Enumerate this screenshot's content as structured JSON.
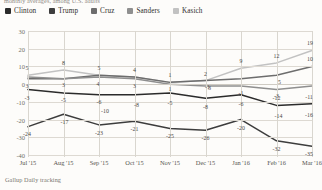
{
  "subtitle": "monthly averages, among U.S. adults",
  "footer": "Gallup Daily tracking",
  "legend": {
    "items": [
      {
        "label": "Clinton",
        "color": "#2b2b2b"
      },
      {
        "label": "Trump",
        "color": "#3d3d3d"
      },
      {
        "label": "Cruz",
        "color": "#6d6d6d"
      },
      {
        "label": "Sanders",
        "color": "#8f8f8f"
      },
      {
        "label": "Kasich",
        "color": "#c2c2c2"
      }
    ]
  },
  "chart_data": {
    "type": "line",
    "title": "",
    "subtitle": "monthly averages, among U.S. adults",
    "xlabel": "",
    "ylabel": "",
    "grid": true,
    "legend_position": "top",
    "ylim": [
      -40,
      30
    ],
    "yticks": [
      30,
      20,
      10,
      0,
      -10,
      -20,
      -30,
      -40
    ],
    "categories": [
      "Jul '15",
      "Aug '15",
      "Sep '15",
      "Oct '15",
      "Nov '15",
      "Dec '15",
      "Jan '16",
      "Feb '16",
      "Mar '16"
    ],
    "series": [
      {
        "name": "Kasich",
        "color": "#c2c2c2",
        "values": [
          5,
          8,
          5,
          4,
          1,
          2,
          9,
          12,
          19
        ]
      },
      {
        "name": "Cruz",
        "color": "#6d6d6d",
        "values": [
          3,
          3,
          5,
          4,
          1,
          2,
          3,
          5,
          10
        ]
      },
      {
        "name": "Sanders",
        "color": "#8f8f8f",
        "values": [
          4,
          3,
          4,
          3,
          0,
          -1,
          -1,
          -3,
          -1
        ]
      },
      {
        "name": "Clinton",
        "color": "#2b2b2b",
        "values": [
          -3,
          -5,
          -6,
          -6,
          -5,
          -8,
          -6,
          -12,
          -11
        ]
      },
      {
        "name": "Trump",
        "color": "#3d3d3d",
        "values": [
          -24,
          -17,
          -23,
          -21,
          -25,
          -26,
          -20,
          -32,
          -35
        ]
      }
    ],
    "point_labels": [
      {
        "text": "5",
        "x": 0,
        "y": 5,
        "dx": -1,
        "dy": -7
      },
      {
        "text": "8",
        "x": 1,
        "y": 8,
        "dx": 0,
        "dy": -7
      },
      {
        "text": "5",
        "x": 2,
        "y": 5,
        "dx": 0,
        "dy": -7
      },
      {
        "text": "4",
        "x": 3,
        "y": 4,
        "dx": 0,
        "dy": -7
      },
      {
        "text": "1",
        "x": 4,
        "y": 1,
        "dx": 0,
        "dy": -7
      },
      {
        "text": "2",
        "x": 5,
        "y": 2,
        "dx": 0,
        "dy": -7
      },
      {
        "text": "9",
        "x": 6,
        "y": 9,
        "dx": 0,
        "dy": -7
      },
      {
        "text": "12",
        "x": 7,
        "y": 12,
        "dx": 0,
        "dy": -7
      },
      {
        "text": "19",
        "x": 8,
        "y": 19,
        "dx": -2,
        "dy": -7
      },
      {
        "text": "3",
        "x": 1,
        "y": 3,
        "dx": 0,
        "dy": 6
      },
      {
        "text": "3",
        "x": 5,
        "y": 2,
        "dx": 4,
        "dy": 7
      },
      {
        "text": "5",
        "x": 7,
        "y": 5,
        "dx": 3,
        "dy": 7
      },
      {
        "text": "10",
        "x": 8,
        "y": 10,
        "dx": -2,
        "dy": -7
      },
      {
        "text": "3",
        "x": 0,
        "y": 3,
        "dx": -1,
        "dy": 7
      },
      {
        "text": "4",
        "x": 2,
        "y": 4,
        "dx": -1,
        "dy": 7
      },
      {
        "text": "3",
        "x": 3,
        "y": 3,
        "dx": 0,
        "dy": 7
      },
      {
        "text": "1",
        "x": 4,
        "y": 1,
        "dx": 0,
        "dy": 7
      },
      {
        "text": "-1",
        "x": 6,
        "y": -1,
        "dx": 0,
        "dy": 7
      },
      {
        "text": "-3",
        "x": 7,
        "y": -3,
        "dx": 0,
        "dy": 7
      },
      {
        "text": "-3",
        "x": 0,
        "y": -3,
        "dx": -1,
        "dy": 9
      },
      {
        "text": "-5",
        "x": 1,
        "y": -5,
        "dx": 0,
        "dy": 7
      },
      {
        "text": "-6",
        "x": 2,
        "y": -6,
        "dx": 0,
        "dy": 7
      },
      {
        "text": "-10",
        "x": 2,
        "y": -6,
        "dx": 6,
        "dy": 16
      },
      {
        "text": "-8",
        "x": 3,
        "y": -6,
        "dx": 2,
        "dy": 10
      },
      {
        "text": "-5",
        "x": 4,
        "y": -5,
        "dx": 0,
        "dy": 10
      },
      {
        "text": "-1",
        "x": 5,
        "y": -1,
        "dx": 2,
        "dy": 1
      },
      {
        "text": "-8",
        "x": 5,
        "y": -8,
        "dx": 0,
        "dy": 9
      },
      {
        "text": "-6",
        "x": 6,
        "y": -6,
        "dx": 0,
        "dy": 9
      },
      {
        "text": "-12",
        "x": 7,
        "y": -12,
        "dx": 0,
        "dy": -7
      },
      {
        "text": "-14",
        "x": 7,
        "y": -12,
        "dx": 2,
        "dy": 11
      },
      {
        "text": "-11",
        "x": 8,
        "y": -11,
        "dx": -3,
        "dy": -7
      },
      {
        "text": "-16",
        "x": 8,
        "y": -11,
        "dx": -3,
        "dy": 11
      },
      {
        "text": "-24",
        "x": 0,
        "y": -24,
        "dx": -1,
        "dy": 7
      },
      {
        "text": "-17",
        "x": 1,
        "y": -17,
        "dx": 1,
        "dy": 8
      },
      {
        "text": "-23",
        "x": 2,
        "y": -23,
        "dx": 0,
        "dy": 8
      },
      {
        "text": "-21",
        "x": 3,
        "y": -21,
        "dx": 0,
        "dy": 8
      },
      {
        "text": "-25",
        "x": 4,
        "y": -25,
        "dx": 0,
        "dy": 8
      },
      {
        "text": "-26",
        "x": 5,
        "y": -26,
        "dx": 0,
        "dy": 8
      },
      {
        "text": "-20",
        "x": 6,
        "y": -20,
        "dx": 0,
        "dy": 8
      },
      {
        "text": "-32",
        "x": 7,
        "y": -32,
        "dx": 0,
        "dy": 8
      },
      {
        "text": "-35",
        "x": 8,
        "y": -35,
        "dx": -3,
        "dy": 8
      }
    ]
  }
}
